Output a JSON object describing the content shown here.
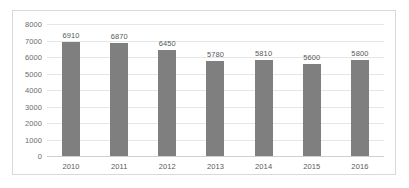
{
  "chart_data": {
    "type": "bar",
    "title": "",
    "subtitle": "",
    "xlabel": "",
    "ylabel": "",
    "categories": [
      "2010",
      "2011",
      "2012",
      "2013",
      "2014",
      "2015",
      "2016"
    ],
    "values": [
      6910,
      6870,
      6450,
      5780,
      5810,
      5600,
      5800
    ],
    "data_labels": [
      "6910",
      "6870",
      "6450",
      "5780",
      "5810",
      "5600",
      "5800"
    ],
    "series": [
      {
        "name": "",
        "values": [
          6910,
          6870,
          6450,
          5780,
          5810,
          5600,
          5800
        ],
        "color": "#7f7f7f"
      }
    ],
    "ylim": [
      0,
      8000
    ],
    "ytick_values": [
      8000,
      7000,
      6000,
      5000,
      4000,
      3000,
      2000,
      1000,
      0
    ],
    "ytick_labels": [
      "8000",
      "7000",
      "6000",
      "5000",
      "4000",
      "3000",
      "2000",
      "1000",
      "0"
    ],
    "ytick_step": 1000,
    "grid": {
      "horizontal": true,
      "vertical": false,
      "color": "#e6e6e6"
    },
    "legend": {
      "visible": false,
      "position": "none",
      "entries": []
    },
    "annotations": [],
    "colors": {
      "bar": "#7f7f7f",
      "gridline": "#e6e6e6",
      "baseline": "#cfcfcf",
      "frame_border": "#d9d9d9",
      "axis_label_text": "#6b6b6b",
      "data_label_text": "#595959",
      "plot_background": "#ffffff"
    }
  }
}
